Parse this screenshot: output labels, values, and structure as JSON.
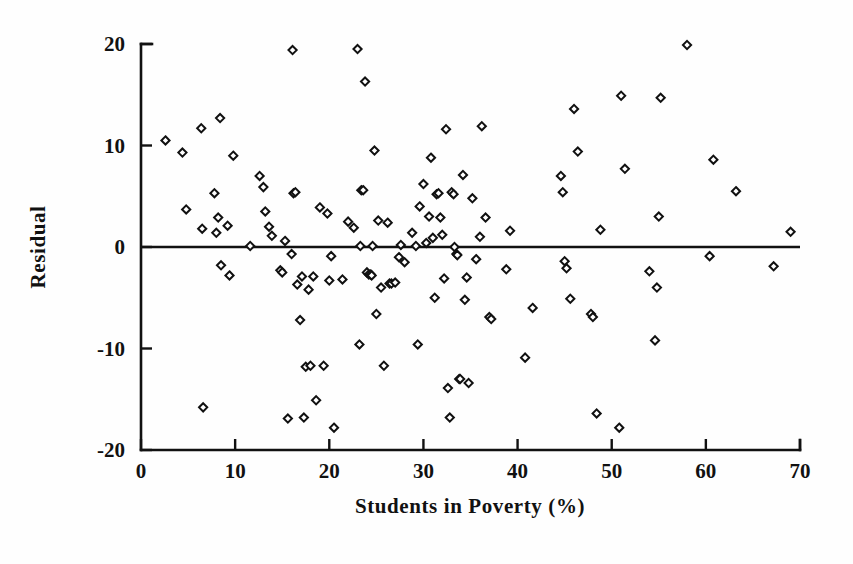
{
  "chart_data": {
    "type": "scatter",
    "title": "",
    "subtitle": "",
    "xlabel": "Students in Poverty (%)",
    "ylabel": "Residual",
    "xlim": [
      0,
      70
    ],
    "ylim": [
      -20,
      20
    ],
    "xticks": [
      0,
      10,
      20,
      30,
      40,
      50,
      60,
      70
    ],
    "yticks": [
      -20,
      -10,
      0,
      10,
      20
    ],
    "xtick_labels": [
      "0",
      "10",
      "20",
      "30",
      "40",
      "50",
      "60",
      "70"
    ],
    "ytick_labels": [
      "-20",
      "-10",
      "0",
      "10",
      "20"
    ],
    "grid": false,
    "legend": null,
    "legend_position": "none",
    "marker": "open-diamond",
    "marker_color": "#111111",
    "marker_fill": "#ffffff",
    "reference_lines": [
      {
        "name": "zero-residual-line",
        "orientation": "horizontal",
        "y": 0,
        "color": "#111111"
      }
    ],
    "n_points": 152,
    "points": [
      [
        2.6,
        10.5
      ],
      [
        4.4,
        9.3
      ],
      [
        4.8,
        3.7
      ],
      [
        6.4,
        11.7
      ],
      [
        6.5,
        1.8
      ],
      [
        6.6,
        -15.8
      ],
      [
        7.8,
        5.3
      ],
      [
        8.0,
        1.4
      ],
      [
        8.2,
        2.9
      ],
      [
        8.4,
        12.7
      ],
      [
        8.5,
        -1.8
      ],
      [
        9.2,
        2.1
      ],
      [
        9.4,
        -2.8
      ],
      [
        9.8,
        9.0
      ],
      [
        11.6,
        0.1
      ],
      [
        12.6,
        7.0
      ],
      [
        13.0,
        5.9
      ],
      [
        13.2,
        3.5
      ],
      [
        13.6,
        2.0
      ],
      [
        13.9,
        1.1
      ],
      [
        14.8,
        -2.3
      ],
      [
        15.0,
        -2.5
      ],
      [
        15.3,
        0.6
      ],
      [
        15.6,
        -16.9
      ],
      [
        16.0,
        -0.7
      ],
      [
        16.1,
        19.4
      ],
      [
        16.2,
        5.3
      ],
      [
        16.4,
        5.4
      ],
      [
        16.6,
        -3.7
      ],
      [
        16.9,
        -7.2
      ],
      [
        17.1,
        -2.9
      ],
      [
        17.3,
        -16.8
      ],
      [
        17.5,
        -11.8
      ],
      [
        17.8,
        -4.2
      ],
      [
        18.0,
        -11.7
      ],
      [
        18.3,
        -2.9
      ],
      [
        18.6,
        -15.1
      ],
      [
        19.0,
        3.9
      ],
      [
        19.4,
        -11.7
      ],
      [
        19.8,
        3.3
      ],
      [
        20.0,
        -3.3
      ],
      [
        20.2,
        -0.9
      ],
      [
        20.5,
        -17.8
      ],
      [
        21.4,
        -3.2
      ],
      [
        22.0,
        2.5
      ],
      [
        22.6,
        1.9
      ],
      [
        23.0,
        19.5
      ],
      [
        23.2,
        -9.6
      ],
      [
        23.3,
        0.1
      ],
      [
        23.4,
        5.6
      ],
      [
        23.6,
        5.6
      ],
      [
        23.8,
        16.3
      ],
      [
        24.0,
        -2.5
      ],
      [
        24.2,
        -2.7
      ],
      [
        24.4,
        -2.7
      ],
      [
        24.5,
        -2.8
      ],
      [
        24.6,
        0.1
      ],
      [
        24.8,
        9.5
      ],
      [
        25.0,
        -6.6
      ],
      [
        25.2,
        2.6
      ],
      [
        25.5,
        -4.0
      ],
      [
        25.8,
        -11.7
      ],
      [
        26.2,
        2.4
      ],
      [
        26.4,
        -3.6
      ],
      [
        26.6,
        -3.6
      ],
      [
        27.0,
        -3.5
      ],
      [
        27.4,
        -1.0
      ],
      [
        27.6,
        0.2
      ],
      [
        28.0,
        -1.5
      ],
      [
        28.8,
        1.4
      ],
      [
        29.2,
        0.1
      ],
      [
        29.4,
        -9.6
      ],
      [
        29.6,
        4.0
      ],
      [
        30.0,
        6.2
      ],
      [
        30.3,
        0.4
      ],
      [
        30.6,
        3.0
      ],
      [
        30.8,
        8.8
      ],
      [
        31.0,
        0.9
      ],
      [
        31.2,
        -5.0
      ],
      [
        31.4,
        5.2
      ],
      [
        31.6,
        5.3
      ],
      [
        31.8,
        2.9
      ],
      [
        32.0,
        1.2
      ],
      [
        32.2,
        -3.1
      ],
      [
        32.4,
        11.6
      ],
      [
        32.6,
        -13.9
      ],
      [
        32.8,
        -16.8
      ],
      [
        33.0,
        5.4
      ],
      [
        33.2,
        5.2
      ],
      [
        33.3,
        0.0
      ],
      [
        33.5,
        -0.7
      ],
      [
        33.6,
        -0.8
      ],
      [
        33.8,
        -13.0
      ],
      [
        33.9,
        -13.0
      ],
      [
        34.2,
        7.1
      ],
      [
        34.4,
        -5.2
      ],
      [
        34.6,
        -3.0
      ],
      [
        34.8,
        -13.4
      ],
      [
        35.2,
        4.8
      ],
      [
        35.6,
        -1.2
      ],
      [
        36.0,
        1.0
      ],
      [
        36.2,
        11.9
      ],
      [
        36.6,
        2.9
      ],
      [
        37.0,
        -6.9
      ],
      [
        37.2,
        -7.1
      ],
      [
        38.8,
        -2.2
      ],
      [
        39.2,
        1.6
      ],
      [
        40.8,
        -10.9
      ],
      [
        41.6,
        -6.0
      ],
      [
        44.6,
        7.0
      ],
      [
        44.8,
        5.4
      ],
      [
        45.0,
        -1.4
      ],
      [
        45.2,
        -2.1
      ],
      [
        45.6,
        -5.1
      ],
      [
        46.0,
        13.6
      ],
      [
        46.4,
        9.4
      ],
      [
        47.8,
        -6.6
      ],
      [
        48.0,
        -6.9
      ],
      [
        48.4,
        -16.4
      ],
      [
        48.8,
        1.7
      ],
      [
        50.8,
        -17.8
      ],
      [
        51.0,
        14.9
      ],
      [
        51.4,
        7.7
      ],
      [
        54.0,
        -2.4
      ],
      [
        54.6,
        -9.2
      ],
      [
        54.8,
        -4.0
      ],
      [
        55.0,
        3.0
      ],
      [
        55.2,
        14.7
      ],
      [
        58.0,
        19.9
      ],
      [
        60.4,
        -0.9
      ],
      [
        60.8,
        8.6
      ],
      [
        63.2,
        5.5
      ],
      [
        67.2,
        -1.9
      ],
      [
        69.0,
        1.5
      ]
    ]
  },
  "figure": {
    "background_color": "#ffffff",
    "axis_color": "#111111",
    "marker_stroke": "#111111"
  }
}
